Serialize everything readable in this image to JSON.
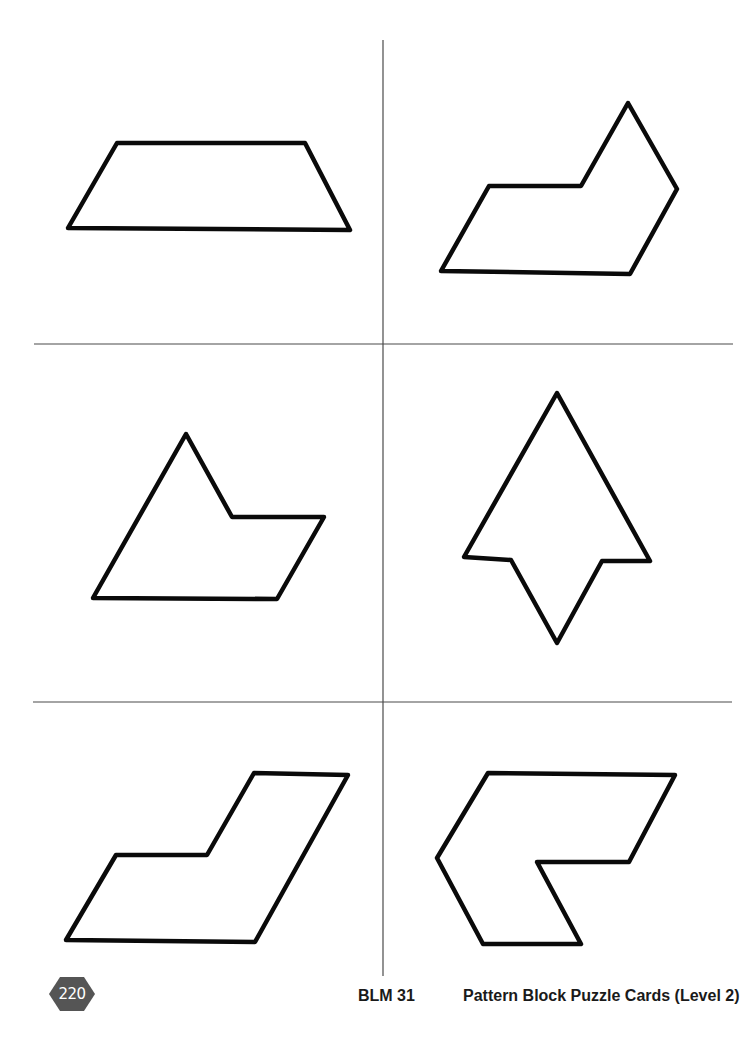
{
  "page": {
    "background": "#ffffff",
    "line_color": "#4a4a4a",
    "shape_stroke": "#0a0a0a"
  },
  "cards": [
    {
      "id": "card-1",
      "shape": "trapezoid",
      "points": "117,143 305,143 350,230 68,228"
    },
    {
      "id": "card-2",
      "shape": "rhombus-with-triangle",
      "points": "441,271 489,186 581,186 628,103 677,189 630,274"
    },
    {
      "id": "card-3",
      "shape": "triangle-with-rhombus",
      "points": "186,434 232,517 324,517 277,599 93,598"
    },
    {
      "id": "card-4",
      "shape": "arrow",
      "points": "557,393 650,561 602,561 557,643 511,560 464,557"
    },
    {
      "id": "card-5",
      "shape": "step-parallelogram",
      "points": "66,940 116,855 207,855 254,773 348,775 255,942"
    },
    {
      "id": "card-6",
      "shape": "chevron",
      "points": "488,773 675,775 629,862 537,862 581,944 483,944 437,858"
    }
  ],
  "footer": {
    "page_number": "220",
    "page_badge_color": "#555555",
    "blm_label": "BLM 31",
    "title": "Pattern Block Puzzle Cards (Level 2)"
  }
}
